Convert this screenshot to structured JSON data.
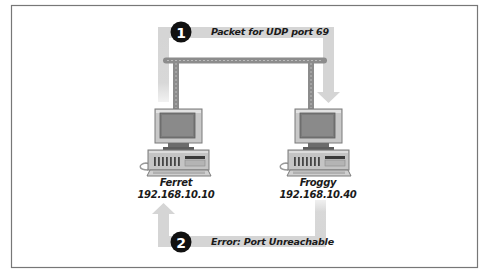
{
  "figure": {
    "frame_color": "#777777",
    "arrow_color": "#d5d5d5",
    "network_color": "#8c8c8c",
    "badge_color": "#111111"
  },
  "steps": [
    {
      "number": "1",
      "label": "Packet for UDP port 69",
      "direction": "Ferret to Froggy"
    },
    {
      "number": "2",
      "label": "Error: Port Unreachable",
      "direction": "Froggy to Ferret"
    }
  ],
  "hosts": [
    {
      "name": "Ferret",
      "ip": "192.168.10.10",
      "icon": "desktop-computer-icon"
    },
    {
      "name": "Froggy",
      "ip": "192.168.10.40",
      "icon": "desktop-computer-icon"
    }
  ],
  "network": {
    "icon": "network-bus"
  }
}
